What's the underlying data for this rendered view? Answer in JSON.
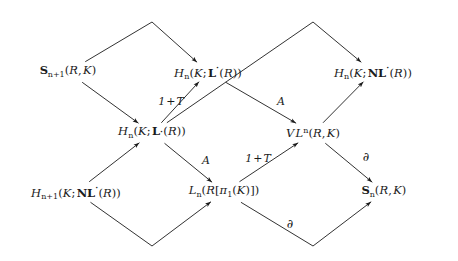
{
  "figure": {
    "kind": "commutative-braid-diagram",
    "background": "#ffffff",
    "ink": "#1b1b1b",
    "nodes": [
      {
        "id": "s-top-left",
        "label": "S_{n+1}(R,K)",
        "x": 68,
        "y": 72
      },
      {
        "id": "h-l-upper",
        "label": "H_n(K;L^.(R))",
        "x": 208,
        "y": 72
      },
      {
        "id": "h-nl-upper",
        "label": "H_n(K;NL^.(R))",
        "x": 373,
        "y": 72
      },
      {
        "id": "h-l-lower",
        "label": "H_n(K;L_.(R))",
        "x": 152,
        "y": 133
      },
      {
        "id": "vl",
        "label": "VL^n(R,K)",
        "x": 313,
        "y": 133
      },
      {
        "id": "h-nl-bottom",
        "label": "H_{n+1}(K;NL^.(R))",
        "x": 76,
        "y": 192
      },
      {
        "id": "l-group-ring",
        "label": "L_n(R[pi_1(K)])",
        "x": 224,
        "y": 192
      },
      {
        "id": "s-bottom",
        "label": "S_n(R,K)",
        "x": 384,
        "y": 192
      }
    ],
    "edge_labels": [
      {
        "id": "one-plus-t-upper",
        "text": "1 + T",
        "x": 171,
        "y": 101
      },
      {
        "id": "a-upper",
        "text": "A",
        "x": 281,
        "y": 101
      },
      {
        "id": "a-lower",
        "text": "A",
        "x": 206,
        "y": 160
      },
      {
        "id": "one-plus-t-lower",
        "text": "1 + T",
        "x": 258,
        "y": 158
      },
      {
        "id": "partial-right",
        "text": "∂",
        "x": 366,
        "y": 157
      },
      {
        "id": "partial-bottom",
        "text": "∂",
        "x": 290,
        "y": 224
      }
    ],
    "edges": [
      {
        "id": "edge-s-top-left-to-h-l-upper",
        "from": "s-top-left",
        "to": "h-l-upper",
        "shape": "peak",
        "apex_x": 152,
        "apex_y": 22
      },
      {
        "id": "edge-h-l-lower-to-h-nl-upper",
        "from": "h-l-lower",
        "to": "h-nl-upper",
        "shape": "peak",
        "apex_x": 313,
        "apex_y": 22
      },
      {
        "id": "edge-s-top-left-to-h-l-lower",
        "from": "s-top-left",
        "to": "h-l-lower",
        "shape": "line"
      },
      {
        "id": "edge-h-l-lower-to-h-l-upper",
        "from": "h-l-lower",
        "to": "h-l-upper",
        "shape": "line"
      },
      {
        "id": "edge-h-l-upper-to-vl",
        "from": "h-l-upper",
        "to": "vl",
        "shape": "line"
      },
      {
        "id": "edge-vl-to-h-nl-upper",
        "from": "vl",
        "to": "h-nl-upper",
        "shape": "line"
      },
      {
        "id": "edge-h-nl-bottom-to-h-l-lower",
        "from": "h-nl-bottom",
        "to": "h-l-lower",
        "shape": "line"
      },
      {
        "id": "edge-h-l-lower-to-l-group-ring",
        "from": "h-l-lower",
        "to": "l-group-ring",
        "shape": "line"
      },
      {
        "id": "edge-l-group-ring-to-vl",
        "from": "l-group-ring",
        "to": "vl",
        "shape": "line"
      },
      {
        "id": "edge-vl-to-s-bottom",
        "from": "vl",
        "to": "s-bottom",
        "shape": "line"
      },
      {
        "id": "edge-h-nl-bottom-to-l-group-ring",
        "from": "h-nl-bottom",
        "to": "l-group-ring",
        "shape": "valley",
        "apex_x": 152,
        "apex_y": 246
      },
      {
        "id": "edge-l-group-ring-to-s-bottom",
        "from": "l-group-ring",
        "to": "s-bottom",
        "shape": "valley",
        "apex_x": 313,
        "apex_y": 246
      }
    ]
  }
}
